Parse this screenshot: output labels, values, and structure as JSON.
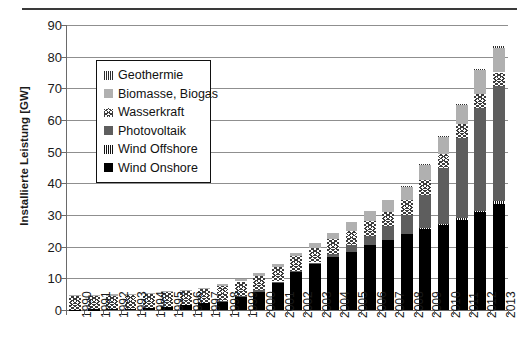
{
  "chart_data": {
    "type": "bar",
    "stacked": true,
    "title": "",
    "xlabel": "",
    "ylabel": "Installierte Leistung [GW]",
    "ylim": [
      0,
      90
    ],
    "ytick_step": 10,
    "yticks": [
      "90",
      "80",
      "70",
      "60",
      "50",
      "40",
      "30",
      "20",
      "10",
      "0"
    ],
    "grid": true,
    "legend_position": "upper-left-inside",
    "categories": [
      "1990",
      "1991",
      "1992",
      "1993",
      "1994",
      "1995",
      "1996",
      "1997",
      "1998",
      "1999",
      "2000",
      "2001",
      "2002",
      "2003",
      "2004",
      "2005",
      "2006",
      "2007",
      "2008",
      "2009",
      "2010",
      "2011",
      "2012",
      "2013"
    ],
    "series": [
      {
        "name": "Wind Onshore",
        "key": "wind_onshore",
        "color": "#000000",
        "pattern": "solid-black",
        "values": [
          0.1,
          0.2,
          0.3,
          0.4,
          0.6,
          1.1,
          1.5,
          2.1,
          2.9,
          4.4,
          6.1,
          8.8,
          12.0,
          14.6,
          16.6,
          18.4,
          20.6,
          22.2,
          23.9,
          25.7,
          27.0,
          28.7,
          31.0,
          33.4
        ]
      },
      {
        "name": "Wind Offshore",
        "key": "wind_offshore",
        "color": "#111111",
        "pattern": "vertical-hatch",
        "values": [
          0,
          0,
          0,
          0,
          0,
          0,
          0,
          0,
          0,
          0,
          0,
          0,
          0,
          0,
          0,
          0,
          0,
          0,
          0,
          0.1,
          0.1,
          0.2,
          0.3,
          0.9
        ]
      },
      {
        "name": "Photovoltaik",
        "key": "photovoltaik",
        "color": "#5e5e5e",
        "pattern": "solid-dark-gray",
        "values": [
          0.0,
          0.0,
          0.0,
          0.0,
          0.0,
          0.0,
          0.0,
          0.0,
          0.1,
          0.1,
          0.1,
          0.2,
          0.3,
          0.4,
          1.1,
          2.1,
          2.9,
          4.2,
          6.1,
          10.6,
          17.6,
          25.4,
          32.6,
          36.3
        ]
      },
      {
        "name": "Wasserkraft",
        "key": "wasserkraft",
        "color": "#3c3c3c",
        "pattern": "zigzag-chevron",
        "values": [
          4.4,
          4.4,
          4.4,
          4.4,
          4.5,
          4.5,
          4.5,
          4.5,
          4.5,
          4.5,
          4.6,
          4.6,
          4.6,
          4.6,
          4.6,
          4.6,
          4.7,
          4.7,
          4.7,
          4.7,
          4.7,
          4.4,
          4.4,
          4.4
        ]
      },
      {
        "name": "Biomasse, Biogas",
        "key": "biomasse",
        "color": "#b0b0b0",
        "pattern": "solid-light-gray",
        "values": [
          0.2,
          0.2,
          0.2,
          0.3,
          0.3,
          0.4,
          0.4,
          0.5,
          0.6,
          0.7,
          0.8,
          1.0,
          1.2,
          1.5,
          2.0,
          2.6,
          3.1,
          3.7,
          4.4,
          5.0,
          5.6,
          6.4,
          7.7,
          8.2
        ]
      },
      {
        "name": "Geothermie",
        "key": "geothermie",
        "color": "#2b2b2b",
        "pattern": "vertical-hatch",
        "values": [
          0,
          0,
          0,
          0,
          0,
          0,
          0,
          0,
          0,
          0,
          0,
          0,
          0,
          0,
          0,
          0,
          0,
          0,
          0.01,
          0.01,
          0.01,
          0.01,
          0.02,
          0.03
        ]
      }
    ],
    "totals": [
      4.7,
      4.8,
      4.9,
      5.1,
      5.4,
      6.0,
      6.4,
      7.1,
      8.1,
      9.7,
      11.6,
      14.6,
      18.1,
      21.1,
      24.3,
      27.7,
      31.3,
      34.8,
      39.1,
      46.1,
      55.0,
      65.1,
      76.0,
      83.2
    ]
  },
  "legend": {
    "items": [
      {
        "label": "Geothermie",
        "key": "geothermie"
      },
      {
        "label": "Biomasse, Biogas",
        "key": "biomasse"
      },
      {
        "label": "Wasserkraft",
        "key": "wasserkraft"
      },
      {
        "label": "Photovoltaik",
        "key": "photovoltaik"
      },
      {
        "label": "Wind Offshore",
        "key": "wind_offshore"
      },
      {
        "label": "Wind Onshore",
        "key": "wind_onshore"
      }
    ]
  }
}
